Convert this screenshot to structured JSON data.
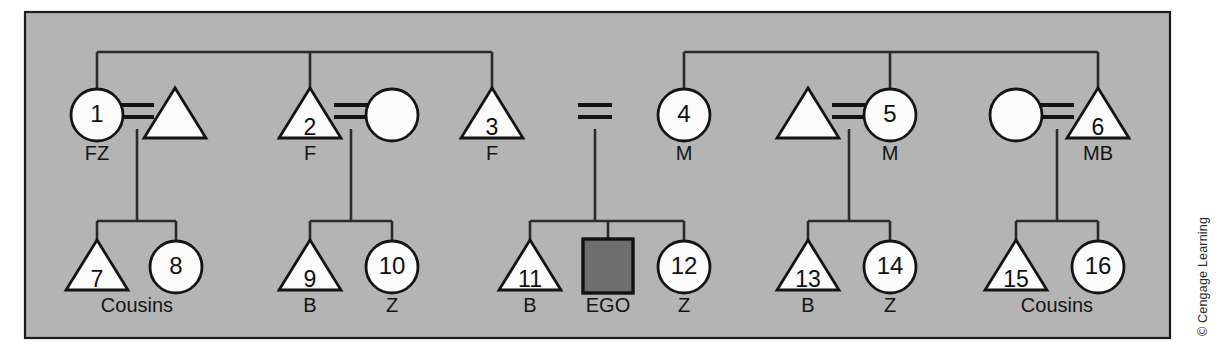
{
  "figure": {
    "panel": {
      "background_color": "#b4b4b4",
      "border_color": "#1c1c1c"
    },
    "line_color": "#2b2b2b",
    "ego_fill_color": "#6e6e6e",
    "symbol_fill_color": "#fbfbfb",
    "credit": "© Cengage Learning"
  },
  "legend_shapes": {
    "triangle": "male",
    "circle": "female",
    "square": "ego",
    "equals": "marriage-tie"
  },
  "generations": [
    {
      "name": "parental-generation",
      "persons": [
        {
          "id": "1",
          "number": "1",
          "shape": "circle",
          "label": "FZ",
          "cx": 97,
          "cy": 115
        },
        {
          "id": "p1",
          "number": "",
          "shape": "triangle",
          "label": "",
          "cx": 175,
          "cy": 115
        },
        {
          "id": "2",
          "number": "2",
          "shape": "triangle",
          "label": "F",
          "cx": 310,
          "cy": 115
        },
        {
          "id": "p2",
          "number": "",
          "shape": "circle",
          "label": "",
          "cx": 392,
          "cy": 115
        },
        {
          "id": "3",
          "number": "3",
          "shape": "triangle",
          "label": "F",
          "cx": 492,
          "cy": 115
        },
        {
          "id": "4",
          "number": "4",
          "shape": "circle",
          "label": "M",
          "cx": 684,
          "cy": 115
        },
        {
          "id": "p3",
          "number": "",
          "shape": "triangle",
          "label": "",
          "cx": 808,
          "cy": 115
        },
        {
          "id": "5",
          "number": "5",
          "shape": "circle",
          "label": "M",
          "cx": 890,
          "cy": 115
        },
        {
          "id": "p4",
          "number": "",
          "shape": "circle",
          "label": "",
          "cx": 1016,
          "cy": 115
        },
        {
          "id": "6",
          "number": "6",
          "shape": "triangle",
          "label": "MB",
          "cx": 1098,
          "cy": 115
        }
      ]
    },
    {
      "name": "ego-generation",
      "persons": [
        {
          "id": "7",
          "number": "7",
          "shape": "triangle",
          "label": "Cousins",
          "cx": 97,
          "cy": 267
        },
        {
          "id": "8",
          "number": "8",
          "shape": "circle",
          "label": "",
          "cx": 176,
          "cy": 267
        },
        {
          "id": "9",
          "number": "9",
          "shape": "triangle",
          "label": "B",
          "cx": 310,
          "cy": 267
        },
        {
          "id": "10",
          "number": "10",
          "shape": "circle",
          "label": "Z",
          "cx": 392,
          "cy": 267
        },
        {
          "id": "11",
          "number": "11",
          "shape": "triangle",
          "label": "B",
          "cx": 530,
          "cy": 267
        },
        {
          "id": "12",
          "number": "12",
          "shape": "circle",
          "label": "Z",
          "cx": 684,
          "cy": 267
        },
        {
          "id": "13",
          "number": "13",
          "shape": "triangle",
          "label": "B",
          "cx": 808,
          "cy": 267
        },
        {
          "id": "14",
          "number": "14",
          "shape": "circle",
          "label": "Z",
          "cx": 890,
          "cy": 267
        },
        {
          "id": "15",
          "number": "15",
          "shape": "triangle",
          "label": "Cousins",
          "cx": 1016,
          "cy": 267
        },
        {
          "id": "16",
          "number": "16",
          "shape": "circle",
          "label": "",
          "cx": 1098,
          "cy": 267
        }
      ],
      "ego": {
        "id": "EGO",
        "number": "",
        "shape": "square",
        "label": "EGO",
        "cx": 608,
        "cy": 266
      }
    }
  ],
  "cousin_group_labels": [
    {
      "text": "Cousins",
      "x": 137,
      "y": 312
    },
    {
      "text": "Cousins",
      "x": 1057,
      "y": 312
    }
  ],
  "labels_row_top": [
    {
      "text": "FZ",
      "x": 97,
      "y": 160
    },
    {
      "text": "F",
      "x": 310,
      "y": 160
    },
    {
      "text": "F",
      "x": 492,
      "y": 160
    },
    {
      "text": "M",
      "x": 684,
      "y": 160
    },
    {
      "text": "M",
      "x": 890,
      "y": 160
    },
    {
      "text": "MB",
      "x": 1098,
      "y": 160
    }
  ],
  "labels_row_bottom": [
    {
      "text": "B",
      "x": 310,
      "y": 312
    },
    {
      "text": "Z",
      "x": 392,
      "y": 312
    },
    {
      "text": "B",
      "x": 530,
      "y": 312
    },
    {
      "text": "EGO",
      "x": 608,
      "y": 312
    },
    {
      "text": "Z",
      "x": 684,
      "y": 312
    },
    {
      "text": "B",
      "x": 808,
      "y": 312
    },
    {
      "text": "Z",
      "x": 890,
      "y": 312
    }
  ],
  "sibling_bars": [
    {
      "name": "left-parental-sibling-bar",
      "y": 52,
      "x1": 97,
      "x2": 492,
      "drops": [
        97,
        310,
        492
      ]
    },
    {
      "name": "right-parental-sibling-bar",
      "y": 52,
      "x1": 684,
      "x2": 1098,
      "drops": [
        684,
        890,
        1098
      ]
    }
  ],
  "descent_bars": [
    {
      "name": "descent-bar-1",
      "y": 221,
      "x1": 97,
      "x2": 176,
      "from_x": 137,
      "drops": [
        97,
        176
      ]
    },
    {
      "name": "descent-bar-2",
      "y": 221,
      "x1": 310,
      "x2": 392,
      "from_x": 351,
      "drops": [
        310,
        392
      ]
    },
    {
      "name": "descent-bar-3",
      "y": 221,
      "x1": 530,
      "x2": 684,
      "from_x": 608,
      "drops": [
        530,
        608,
        684
      ]
    },
    {
      "name": "descent-bar-4",
      "y": 221,
      "x1": 808,
      "x2": 890,
      "from_x": 849,
      "drops": [
        808,
        890
      ]
    },
    {
      "name": "descent-bar-5",
      "y": 221,
      "x1": 1016,
      "x2": 1098,
      "from_x": 1057,
      "drops": [
        1016,
        1098
      ]
    }
  ],
  "marriages": [
    {
      "name": "marriage-1-and-spouse",
      "x": 137,
      "y": 112,
      "descent_to_y": 221
    },
    {
      "name": "marriage-2-and-spouse",
      "x": 351,
      "y": 112,
      "descent_to_y": 221
    },
    {
      "name": "marriage-3-and-4",
      "x": 595,
      "y": 112,
      "descent_to_y": 221
    },
    {
      "name": "marriage-5-and-spouse",
      "x": 849,
      "y": 112,
      "descent_to_y": 221
    },
    {
      "name": "marriage-6-and-spouse",
      "x": 1057,
      "y": 112,
      "descent_to_y": 221
    }
  ]
}
